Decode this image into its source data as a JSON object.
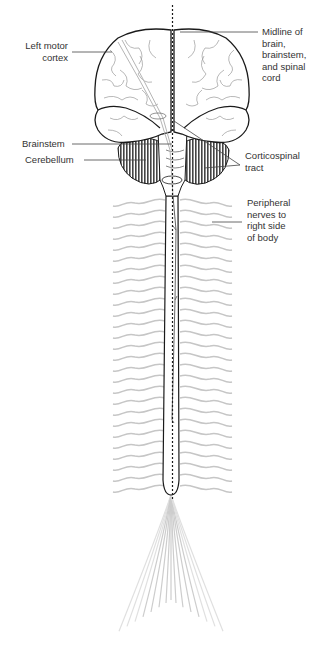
{
  "figure": {
    "labels": {
      "left_motor_cortex": [
        "Left motor",
        "cortex"
      ],
      "midline": [
        "Midline of",
        "brain,",
        "brainstem,",
        "and spinal",
        "cord"
      ],
      "brainstem": "Brainstem",
      "cerebellum": "Cerebellum",
      "corticospinal_tract": [
        "Corticospinal",
        "tract"
      ],
      "peripheral_nerves": [
        "Peripheral",
        "nerves to",
        "right side",
        "of body"
      ]
    },
    "colors": {
      "outline": "#1a1a1a",
      "cerebellum_fill": "#7a7a7a",
      "nerve_gray": "#bdbdbd",
      "leader_line": "#444444"
    }
  }
}
